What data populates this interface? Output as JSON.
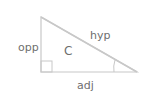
{
  "diagram": {
    "type": "right-triangle",
    "labels": {
      "opposite": "opp",
      "hypotenuse": "hyp",
      "adjacent": "adj",
      "angle": "C"
    },
    "colors": {
      "stroke": "#c8c8c8",
      "text": "#6e6e6e"
    }
  }
}
